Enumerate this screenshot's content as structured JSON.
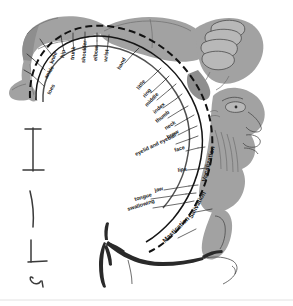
{
  "figure": {
    "name": "motor-homunculus",
    "colors": {
      "body_gray": "#a2a2a2",
      "body_gray_dark": "#8e8e8e",
      "body_gray_light": "#b8b8b8",
      "ink": "#1a1a1a",
      "background": "#ffffff"
    }
  },
  "labels": {
    "arc": [
      {
        "id": "toes",
        "text": "toes",
        "x": 50,
        "y": 95,
        "rot": -62,
        "lx1": 44,
        "ly1": 86,
        "lx2": 31,
        "ly2": 74,
        "tick_x1": 31,
        "tick_y1": 74,
        "tick_x2": 24,
        "tick_y2": 70
      },
      {
        "id": "ankle",
        "text": "ankle",
        "x": 47,
        "y": 79,
        "rot": -58,
        "lx1": 45,
        "ly1": 70,
        "lx2": 33,
        "ly2": 59,
        "tick_x1": 33,
        "tick_y1": 59,
        "tick_x2": 27,
        "tick_y2": 54
      },
      {
        "id": "knee",
        "text": "knee",
        "x": 53,
        "y": 64,
        "rot": -70,
        "lx1": 52,
        "ly1": 55,
        "lx2": 44,
        "ly2": 45,
        "tick_x1": 44,
        "tick_y1": 45,
        "tick_x2": 40,
        "tick_y2": 39
      },
      {
        "id": "hip",
        "text": "hip",
        "x": 64,
        "y": 58,
        "rot": -82,
        "lx1": 64,
        "ly1": 51,
        "lx2": 62,
        "ly2": 42,
        "tick_x1": 62,
        "tick_y1": 42,
        "tick_x2": 61,
        "tick_y2": 35
      },
      {
        "id": "trunk",
        "text": "trunk",
        "x": 74,
        "y": 60,
        "rot": -85,
        "lx1": 74,
        "ly1": 50,
        "lx2": 73,
        "ly2": 41,
        "tick_x1": 73,
        "tick_y1": 41,
        "tick_x2": 73,
        "tick_y2": 33
      },
      {
        "id": "shoulder",
        "text": "shoulder",
        "x": 85,
        "y": 63,
        "rot": -86,
        "lx1": 85,
        "ly1": 49,
        "lx2": 85,
        "ly2": 40,
        "tick_x1": 85,
        "tick_y1": 40,
        "tick_x2": 85,
        "tick_y2": 32
      },
      {
        "id": "elbow",
        "text": "elbow",
        "x": 97,
        "y": 61,
        "rot": -86,
        "lx1": 97,
        "ly1": 50,
        "lx2": 97,
        "ly2": 41,
        "tick_x1": 97,
        "tick_y1": 41,
        "tick_x2": 97,
        "tick_y2": 33
      },
      {
        "id": "wrist",
        "text": "wrist",
        "x": 107,
        "y": 62,
        "rot": -82,
        "lx1": 107,
        "ly1": 52,
        "lx2": 108,
        "ly2": 43,
        "tick_x1": 108,
        "tick_y1": 43,
        "tick_x2": 109,
        "tick_y2": 35
      },
      {
        "id": "hand",
        "text": "hand",
        "x": 120,
        "y": 70,
        "rot": -62,
        "lx1": 125,
        "ly1": 63,
        "lx2": 133,
        "ly2": 54,
        "tick_x1": 133,
        "tick_y1": 54,
        "tick_x2": 139,
        "tick_y2": 48
      },
      {
        "id": "little",
        "text": "little",
        "x": 139,
        "y": 90,
        "rot": -52,
        "lx1": 144,
        "ly1": 84,
        "lx2": 155,
        "ly2": 74,
        "tick_x1": 155,
        "tick_y1": 74,
        "tick_x2": 161,
        "tick_y2": 68
      },
      {
        "id": "ring",
        "text": "ring",
        "x": 145,
        "y": 98,
        "rot": -50,
        "lx1": 151,
        "ly1": 93,
        "lx2": 163,
        "ly2": 82,
        "tick_x1": 163,
        "tick_y1": 82,
        "tick_x2": 169,
        "tick_y2": 76
      },
      {
        "id": "middle",
        "text": "middle",
        "x": 147,
        "y": 107,
        "rot": -46,
        "lx1": 157,
        "ly1": 100,
        "lx2": 169,
        "ly2": 90,
        "tick_x1": 169,
        "tick_y1": 90,
        "tick_x2": 176,
        "tick_y2": 84
      },
      {
        "id": "index",
        "text": "index",
        "x": 155,
        "y": 114,
        "rot": -42,
        "lx1": 163,
        "ly1": 108,
        "lx2": 176,
        "ly2": 99,
        "tick_x1": 176,
        "tick_y1": 99,
        "tick_x2": 182,
        "tick_y2": 94
      },
      {
        "id": "thumb",
        "text": "thumb",
        "x": 157,
        "y": 123,
        "rot": -38,
        "lx1": 168,
        "ly1": 118,
        "lx2": 181,
        "ly2": 110,
        "tick_x1": 181,
        "tick_y1": 110,
        "tick_x2": 188,
        "tick_y2": 106
      },
      {
        "id": "neck",
        "text": "neck",
        "x": 166,
        "y": 130,
        "rot": -34,
        "lx1": 175,
        "ly1": 126,
        "lx2": 187,
        "ly2": 119,
        "tick_x1": 187,
        "tick_y1": 119,
        "tick_x2": 194,
        "tick_y2": 115
      },
      {
        "id": "brow",
        "text": "brow",
        "x": 168,
        "y": 139,
        "rot": -30,
        "lx1": 178,
        "ly1": 135,
        "lx2": 190,
        "ly2": 129,
        "tick_x1": 190,
        "tick_y1": 129,
        "tick_x2": 197,
        "tick_y2": 126
      },
      {
        "id": "eyelid-and-eyeball",
        "text": "eyelid and eyeball",
        "x": 136,
        "y": 156,
        "rot": -26,
        "lx1": 176,
        "ly1": 144,
        "lx2": 190,
        "ly2": 139,
        "tick_x1": 190,
        "tick_y1": 139,
        "tick_x2": 198,
        "tick_y2": 136
      },
      {
        "id": "face",
        "text": "face",
        "x": 175,
        "y": 152,
        "rot": -18,
        "lx1": 186,
        "ly1": 151,
        "lx2": 198,
        "ly2": 148,
        "tick_x1": 198,
        "tick_y1": 148,
        "tick_x2": 205,
        "tick_y2": 147
      },
      {
        "id": "lips",
        "text": "lips",
        "x": 178,
        "y": 172,
        "rot": -8,
        "lx1": 187,
        "ly1": 170,
        "lx2": 199,
        "ly2": 169,
        "tick_x1": 199,
        "tick_y1": 169,
        "tick_x2": 206,
        "tick_y2": 168
      },
      {
        "id": "jaw",
        "text": "jaw",
        "x": 155,
        "y": 192,
        "rot": -14,
        "lx1": 164,
        "ly1": 190,
        "lx2": 189,
        "ly2": 186,
        "tick_x1": 189,
        "tick_y1": 186,
        "tick_x2": 198,
        "tick_y2": 185
      },
      {
        "id": "tongue",
        "text": "tongue",
        "x": 135,
        "y": 201,
        "rot": -16,
        "lx1": 151,
        "ly1": 199,
        "lx2": 186,
        "ly2": 194,
        "tick_x1": 186,
        "tick_y1": 194,
        "tick_x2": 196,
        "tick_y2": 193
      },
      {
        "id": "swallowing",
        "text": "swallowing",
        "x": 128,
        "y": 211,
        "rot": -18,
        "lx1": 153,
        "ly1": 208,
        "lx2": 184,
        "ly2": 203,
        "tick_x1": 184,
        "tick_y1": 203,
        "tick_x2": 194,
        "tick_y2": 201
      }
    ],
    "radial_big": [
      {
        "id": "vocalization",
        "text": "Vocalization",
        "x": 206,
        "y": 182,
        "rot": -76
      },
      {
        "id": "salivation",
        "text": "Salivation",
        "x": 192,
        "y": 219,
        "rot": -62
      },
      {
        "id": "mastication",
        "text": "Mastication",
        "x": 165,
        "y": 243,
        "rot": -44
      }
    ],
    "leaders_big": [
      {
        "id": "salivation-leader",
        "x1": 196,
        "y1": 212,
        "x2": 212,
        "y2": 209
      },
      {
        "id": "mastication-leader",
        "x1": 178,
        "y1": 238,
        "x2": 196,
        "y2": 229
      }
    ]
  },
  "anatomy": {
    "leg_foot": "homunculus-leg-and-foot",
    "hand_fingers": "homunculus-hand-with-fingers",
    "face_profile": "homunculus-face-profile",
    "tongue": "homunculus-tongue",
    "fissure": "sylvian-fissure-branching-vessel",
    "cortical_arc": "precentral-gyrus-dashed-arc"
  },
  "artifacts": {
    "marks": [
      {
        "id": "mark-1"
      },
      {
        "id": "mark-2"
      },
      {
        "id": "mark-3"
      },
      {
        "id": "mark-4"
      }
    ],
    "footer_rule": "faint-horizontal-rule"
  }
}
